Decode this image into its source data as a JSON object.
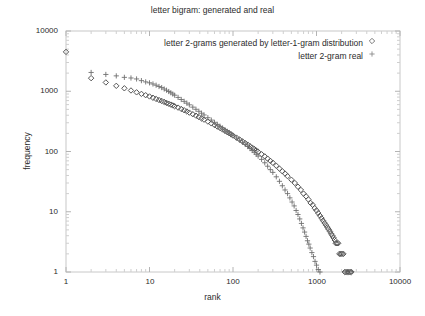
{
  "chart": {
    "title": "letter bigram: generated and real",
    "xlabel": "rank",
    "ylabel": "frequency"
  },
  "legend": {
    "entries": [
      {
        "label": "letter 2-grams generated by letter-1-gram distribution",
        "marker": "diamond-marker",
        "color": "#7a7a7a"
      },
      {
        "label": "letter 2-gram real",
        "marker": "plus-marker",
        "color": "#8a8a8a"
      }
    ]
  },
  "axes": {
    "x_ticks": [
      "1",
      "10",
      "100",
      "1000",
      "10000"
    ],
    "y_ticks": [
      "1",
      "10",
      "100",
      "1000",
      "10000"
    ]
  },
  "chart_data": {
    "type": "scatter",
    "title": "letter bigram: generated and real",
    "xlabel": "rank",
    "ylabel": "frequency",
    "xscale": "log",
    "yscale": "log",
    "xlim": [
      1,
      10000
    ],
    "ylim": [
      1,
      10000
    ],
    "grid": false,
    "legend_position": "top-right-inside",
    "series": [
      {
        "name": "letter 2-grams generated by letter-1-gram distribution",
        "marker": "diamond",
        "color": "#555555",
        "points": [
          [
            1,
            4500
          ],
          [
            2,
            1650
          ],
          [
            3,
            1400
          ],
          [
            4,
            1230
          ],
          [
            5,
            1120
          ],
          [
            6,
            1030
          ],
          [
            7,
            960
          ],
          [
            8,
            905
          ],
          [
            9,
            860
          ],
          [
            10,
            820
          ],
          [
            11,
            780
          ],
          [
            12,
            745
          ],
          [
            13,
            715
          ],
          [
            14,
            690
          ],
          [
            15,
            665
          ],
          [
            16,
            640
          ],
          [
            17,
            620
          ],
          [
            18,
            600
          ],
          [
            19,
            582
          ],
          [
            20,
            565
          ],
          [
            22,
            535
          ],
          [
            24,
            508
          ],
          [
            26,
            484
          ],
          [
            28,
            462
          ],
          [
            30,
            442
          ],
          [
            33,
            416
          ],
          [
            36,
            393
          ],
          [
            39,
            373
          ],
          [
            42,
            354
          ],
          [
            45,
            338
          ],
          [
            50,
            314
          ],
          [
            55,
            293
          ],
          [
            60,
            275
          ],
          [
            65,
            259
          ],
          [
            70,
            245
          ],
          [
            75,
            232
          ],
          [
            80,
            221
          ],
          [
            85,
            210
          ],
          [
            90,
            201
          ],
          [
            95,
            192
          ],
          [
            100,
            184
          ],
          [
            110,
            170
          ],
          [
            120,
            158
          ],
          [
            130,
            147
          ],
          [
            140,
            138
          ],
          [
            150,
            130
          ],
          [
            160,
            122
          ],
          [
            170,
            116
          ],
          [
            180,
            110
          ],
          [
            190,
            104
          ],
          [
            200,
            99
          ],
          [
            220,
            90
          ],
          [
            240,
            83
          ],
          [
            260,
            76
          ],
          [
            280,
            70
          ],
          [
            300,
            65
          ],
          [
            330,
            58
          ],
          [
            360,
            52
          ],
          [
            390,
            47
          ],
          [
            420,
            43
          ],
          [
            450,
            39
          ],
          [
            500,
            34
          ],
          [
            550,
            30
          ],
          [
            600,
            26
          ],
          [
            650,
            23
          ],
          [
            700,
            20
          ],
          [
            750,
            18
          ],
          [
            800,
            16
          ],
          [
            850,
            14
          ],
          [
            900,
            13
          ],
          [
            950,
            11.5
          ],
          [
            1000,
            10.5
          ],
          [
            1050,
            9.5
          ],
          [
            1100,
            8.6
          ],
          [
            1150,
            7.8
          ],
          [
            1200,
            7.1
          ],
          [
            1250,
            6.5
          ],
          [
            1300,
            6.0
          ],
          [
            1350,
            5.5
          ],
          [
            1400,
            5.1
          ],
          [
            1450,
            4.7
          ],
          [
            1500,
            4.3
          ],
          [
            1550,
            4.0
          ],
          [
            1600,
            3.7
          ],
          [
            1650,
            3.4
          ],
          [
            1700,
            3.0
          ],
          [
            1760,
            3.0
          ],
          [
            1820,
            3.0
          ],
          [
            1880,
            2.0
          ],
          [
            1950,
            2.0
          ],
          [
            2020,
            2.0
          ],
          [
            2100,
            2.0
          ],
          [
            2180,
            1.0
          ],
          [
            2260,
            1.0
          ],
          [
            2350,
            1.0
          ],
          [
            2440,
            1.0
          ],
          [
            2530,
            1.0
          ],
          [
            2620,
            1.0
          ]
        ]
      },
      {
        "name": "letter 2-gram real",
        "marker": "plus",
        "color": "#6f6f6f",
        "points": [
          [
            2,
            2050
          ],
          [
            3,
            1900
          ],
          [
            4,
            1800
          ],
          [
            5,
            1700
          ],
          [
            6,
            1660
          ],
          [
            7,
            1600
          ],
          [
            8,
            1500
          ],
          [
            9,
            1430
          ],
          [
            10,
            1380
          ],
          [
            11,
            1320
          ],
          [
            12,
            1260
          ],
          [
            13,
            1200
          ],
          [
            14,
            1150
          ],
          [
            15,
            1090
          ],
          [
            16,
            1040
          ],
          [
            17,
            990
          ],
          [
            18,
            945
          ],
          [
            19,
            900
          ],
          [
            20,
            860
          ],
          [
            22,
            790
          ],
          [
            24,
            730
          ],
          [
            26,
            680
          ],
          [
            28,
            635
          ],
          [
            30,
            595
          ],
          [
            33,
            545
          ],
          [
            36,
            502
          ],
          [
            39,
            465
          ],
          [
            42,
            432
          ],
          [
            45,
            404
          ],
          [
            50,
            364
          ],
          [
            55,
            332
          ],
          [
            60,
            305
          ],
          [
            65,
            282
          ],
          [
            70,
            262
          ],
          [
            75,
            245
          ],
          [
            80,
            230
          ],
          [
            85,
            217
          ],
          [
            90,
            205
          ],
          [
            95,
            194
          ],
          [
            100,
            185
          ],
          [
            110,
            168
          ],
          [
            120,
            154
          ],
          [
            130,
            142
          ],
          [
            140,
            131
          ],
          [
            150,
            121
          ],
          [
            160,
            112
          ],
          [
            170,
            104
          ],
          [
            180,
            97
          ],
          [
            190,
            90
          ],
          [
            200,
            84
          ],
          [
            220,
            74
          ],
          [
            240,
            65
          ],
          [
            260,
            57
          ],
          [
            280,
            50
          ],
          [
            300,
            45
          ],
          [
            330,
            38
          ],
          [
            360,
            32
          ],
          [
            390,
            27
          ],
          [
            420,
            23
          ],
          [
            450,
            20
          ],
          [
            480,
            17
          ],
          [
            510,
            14.5
          ],
          [
            540,
            12.5
          ],
          [
            570,
            10.5
          ],
          [
            600,
            9.0
          ],
          [
            630,
            7.6
          ],
          [
            660,
            6.4
          ],
          [
            690,
            5.4
          ],
          [
            720,
            4.6
          ],
          [
            750,
            3.9
          ],
          [
            780,
            3.3
          ],
          [
            810,
            2.9
          ],
          [
            840,
            2.5
          ],
          [
            880,
            2.1
          ],
          [
            920,
            1.8
          ],
          [
            960,
            1.5
          ],
          [
            1000,
            1.3
          ],
          [
            1050,
            1.1
          ],
          [
            1100,
            1.0
          ]
        ]
      }
    ]
  }
}
